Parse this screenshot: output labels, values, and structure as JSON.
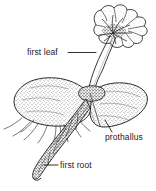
{
  "figure": {
    "kind": "botanical-line-drawing",
    "background_color": "#ffffff",
    "ink_color": "#1a1a1a",
    "labels": [
      {
        "id": "first-leaf",
        "text": "first leaf",
        "leader": "horizontal line to leaf stalk"
      },
      {
        "id": "prothallus",
        "text": "prothallus",
        "leader": "short line up-left into thallus body"
      },
      {
        "id": "first-root",
        "text": "first root",
        "leader": "horizontal line left to root tip"
      }
    ],
    "parts": [
      {
        "id": "leaf",
        "name": "first leaf (lobed frond)"
      },
      {
        "id": "petiole",
        "name": "leaf stalk"
      },
      {
        "id": "prothallus",
        "name": "prothallus (heart-shaped gametophyte)"
      },
      {
        "id": "root",
        "name": "first root"
      },
      {
        "id": "rhizoids",
        "name": "rhizoids"
      }
    ]
  }
}
